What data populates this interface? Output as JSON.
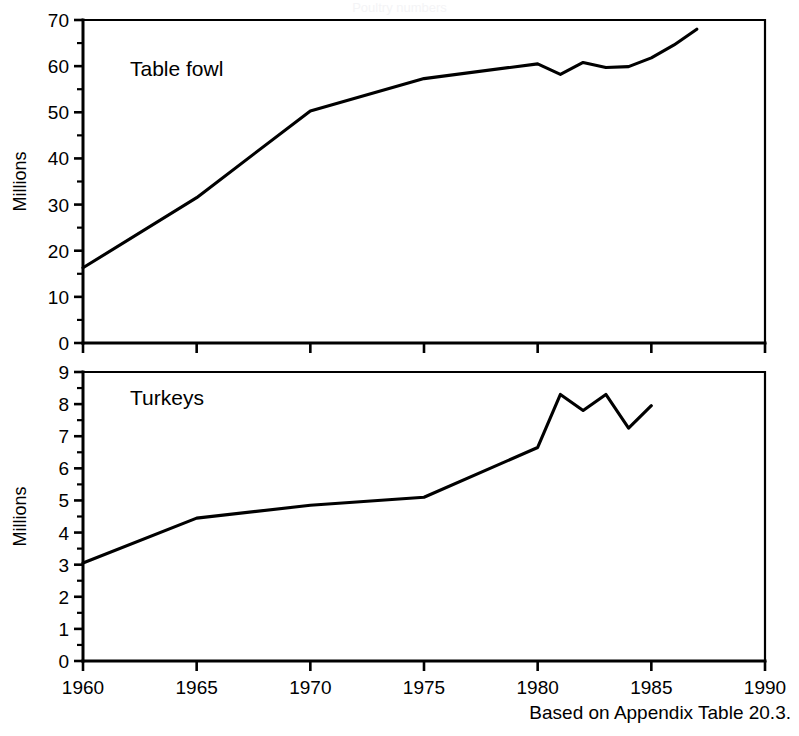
{
  "figure": {
    "source_note": "Based on Appendix Table 20.3.",
    "faint_header": "Poultry numbers"
  },
  "chart_data": [
    {
      "type": "line",
      "title": "",
      "series_label": "Table fowl",
      "xlabel": "",
      "ylabel": "Millions",
      "xlim": [
        1960,
        1990
      ],
      "ylim": [
        0,
        70
      ],
      "xticks": [
        1960,
        1965,
        1970,
        1975,
        1980,
        1985,
        1990
      ],
      "xticklabels": [
        "1960",
        "1965",
        "1970",
        "1975",
        "1980",
        "1985",
        "1990"
      ],
      "yticks": [
        0,
        10,
        20,
        30,
        40,
        50,
        60,
        70
      ],
      "yticklabels": [
        "0",
        "10",
        "20",
        "30",
        "40",
        "50",
        "60",
        "70"
      ],
      "y_minor_step": 5,
      "grid": false,
      "legend": "none",
      "x": [
        1960,
        1965,
        1970,
        1975,
        1980,
        1981,
        1982,
        1983,
        1984,
        1985,
        1986,
        1987
      ],
      "values": [
        16.3,
        31.5,
        50.3,
        57.3,
        60.5,
        58.2,
        60.8,
        59.7,
        59.9,
        61.8,
        64.6,
        68.0
      ]
    },
    {
      "type": "line",
      "title": "",
      "series_label": "Turkeys",
      "xlabel": "",
      "ylabel": "Millions",
      "xlim": [
        1960,
        1990
      ],
      "ylim": [
        0,
        9
      ],
      "xticks": [
        1960,
        1965,
        1970,
        1975,
        1980,
        1985,
        1990
      ],
      "xticklabels": [
        "1960",
        "1965",
        "1970",
        "1975",
        "1980",
        "1985",
        "1990"
      ],
      "yticks": [
        0,
        1,
        2,
        3,
        4,
        5,
        6,
        7,
        8,
        9
      ],
      "yticklabels": [
        "0",
        "1",
        "2",
        "3",
        "4",
        "5",
        "6",
        "7",
        "8",
        "9"
      ],
      "y_minor_step": 0.5,
      "grid": false,
      "legend": "none",
      "x": [
        1960,
        1965,
        1970,
        1975,
        1980,
        1981,
        1982,
        1983,
        1984,
        1985
      ],
      "values": [
        3.05,
        4.45,
        4.85,
        5.1,
        6.65,
        8.3,
        7.8,
        8.3,
        7.25,
        7.95
      ]
    }
  ]
}
